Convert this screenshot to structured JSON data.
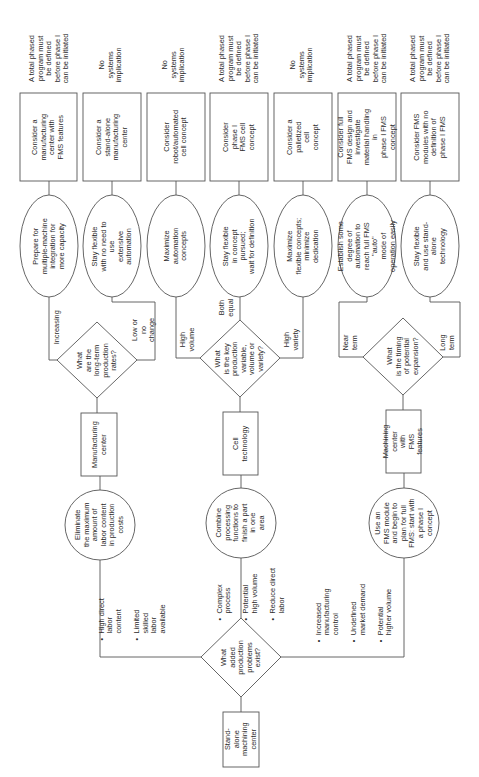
{
  "diagram": {
    "type": "decision-flowchart",
    "orientation": "rotated-90-ccw",
    "start": {
      "label": "Stand-alone\nmachining\ncenter"
    },
    "main_decision": {
      "label": "What\nadded\nproduction\nproblems\nexist?"
    },
    "branches": [
      {
        "condition_bullets": [
          "High direct\nlabor content",
          "Limited skilled\nlabor available"
        ],
        "objective": "Eliminate\nthe maximum\namount of\nlabor content\nin production\ncosts",
        "technology": "Manufacturing\ncenter",
        "decision": "What\nare the\nlong-term\nproduction\nrates?",
        "options": [
          {
            "answer": "Increasing",
            "strategy": "Prepare for\nmultiple-machine\nintegration for\nmore capacity",
            "action": "Consider a\nmanufacturing\ncenter with\nFMS features",
            "implication": "A total phased\nprogram must\nbe defined\nbefore phase I\ncan be initiated"
          },
          {
            "answer": "Low or\nno change",
            "strategy": "Stay flexible\nwith no need to use\nextensive automation",
            "action": "Consider a\nstand-alone\nmanufacturing\ncenter",
            "implication": "No systems\nimplication"
          }
        ]
      },
      {
        "condition_bullets": [
          "Complex\nprocess",
          "Potential\nhigh volume",
          "Reduce direct\nlabor"
        ],
        "objective": "Combine\nprocessing\nfunctions to\nfinish a part\nin one\narea",
        "technology": "Cell\ntechnology",
        "decision": "What\nis the key\nproduction\nvariable,\nvolume or\nvariety?",
        "options": [
          {
            "answer": "High\nvolume",
            "strategy": "Maximize\nautomation\nconcepts",
            "action": "Consider\nrobot/automated\ncell concept",
            "implication": "No systems\nimplication"
          },
          {
            "answer": "Both\nequal",
            "strategy": "Stay flexible\nin concept pursued;\nwait for definition",
            "action": "Consider\nphase I\nFMS cell\nconcept",
            "implication": "A total phased\nprogram must\nbe defined\nbefore phase I\ncan be initiated"
          },
          {
            "answer": "High\nvariety",
            "strategy": "Maximize\nflexible concepts;\nminimize dedication",
            "action": "Consider a\npalletized\ncell\nconcept",
            "implication": "No systems\nimplication"
          }
        ]
      },
      {
        "condition_bullets": [
          "Increased\nmanufacturing control",
          "Undefined\nmarket demand",
          "Potential\nhigher volume"
        ],
        "objective": "Use an\nFMS module\nand begin to\nplan for full\nFMS: start with\na phase I\nconcept",
        "technology": "Machining\ncenter with\nFMS features",
        "decision": "What\nis the timing\nof potential\nexpansion?",
        "options": [
          {
            "answer": "Near\nterm",
            "strategy": "Establish some\ndegree of automation to\nreach full FMS \"auto\"\nmode of\noperation easily",
            "action": "Consider full\nFMS design and\ninvestigate\nmaterial handling in\nphase I FMS concept",
            "implication": "A total phased\nprogram must\nbe defined\nbefore phase I\ncan be initiated"
          },
          {
            "answer": "Long\nterm",
            "strategy": "Stay flexible\nand use stand-alone\ntechnology",
            "action": "Consider FMS\nmodules with no\ndefinition of\nphase I FMS",
            "implication": "A total phased\nprogram must\nbe defined\nbefore phase I\ncan be initiated"
          }
        ]
      }
    ]
  },
  "style": {
    "line_color": "#555555",
    "text_color": "#2b2b2b",
    "background": "#ffffff"
  }
}
